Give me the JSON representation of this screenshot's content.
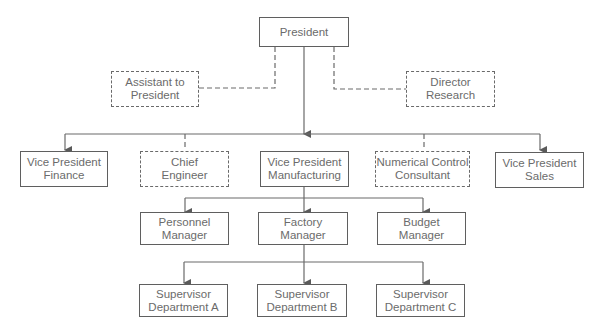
{
  "nodes": {
    "president": {
      "lines": [
        "President"
      ],
      "style": "solid"
    },
    "assistant_to_president": {
      "lines": [
        "Assistant to",
        "President"
      ],
      "style": "dashed"
    },
    "director_research": {
      "lines": [
        "Director",
        "Research"
      ],
      "style": "dashed"
    },
    "vp_finance": {
      "lines": [
        "Vice President",
        "Finance"
      ],
      "style": "solid"
    },
    "chief_engineer": {
      "lines": [
        "Chief",
        "Engineer"
      ],
      "style": "dashed"
    },
    "vp_manufacturing": {
      "lines": [
        "Vice President",
        "Manufacturing"
      ],
      "style": "solid"
    },
    "nc_consultant": {
      "lines": [
        "Numerical Control",
        "Consultant"
      ],
      "style": "dashed"
    },
    "vp_sales": {
      "lines": [
        "Vice President",
        "Sales"
      ],
      "style": "solid"
    },
    "personnel_manager": {
      "lines": [
        "Personnel",
        "Manager"
      ],
      "style": "solid"
    },
    "factory_manager": {
      "lines": [
        "Factory",
        "Manager"
      ],
      "style": "solid"
    },
    "budget_manager": {
      "lines": [
        "Budget",
        "Manager"
      ],
      "style": "solid"
    },
    "supervisor_a": {
      "lines": [
        "Supervisor",
        "Department A"
      ],
      "style": "solid"
    },
    "supervisor_b": {
      "lines": [
        "Supervisor",
        "Department B"
      ],
      "style": "solid"
    },
    "supervisor_c": {
      "lines": [
        "Supervisor",
        "Department C"
      ],
      "style": "solid"
    }
  },
  "edges": [
    {
      "from": "president",
      "to": "assistant_to_president",
      "type": "staff-dashed"
    },
    {
      "from": "president",
      "to": "director_research",
      "type": "staff-dashed"
    },
    {
      "from": "president",
      "to": "vp_finance",
      "type": "line-arrow"
    },
    {
      "from": "president",
      "to": "chief_engineer",
      "type": "staff-dashed"
    },
    {
      "from": "president",
      "to": "vp_manufacturing",
      "type": "line-arrow"
    },
    {
      "from": "president",
      "to": "nc_consultant",
      "type": "staff-dashed"
    },
    {
      "from": "president",
      "to": "vp_sales",
      "type": "line-arrow"
    },
    {
      "from": "vp_manufacturing",
      "to": "personnel_manager",
      "type": "line-arrow"
    },
    {
      "from": "vp_manufacturing",
      "to": "factory_manager",
      "type": "line-arrow"
    },
    {
      "from": "vp_manufacturing",
      "to": "budget_manager",
      "type": "line-arrow"
    },
    {
      "from": "factory_manager",
      "to": "supervisor_a",
      "type": "line-arrow"
    },
    {
      "from": "factory_manager",
      "to": "supervisor_b",
      "type": "line-arrow"
    },
    {
      "from": "factory_manager",
      "to": "supervisor_c",
      "type": "line-arrow"
    }
  ],
  "colors": {
    "line": "#5f5f5f",
    "text": "#6b6b6b",
    "background": "#ffffff"
  }
}
